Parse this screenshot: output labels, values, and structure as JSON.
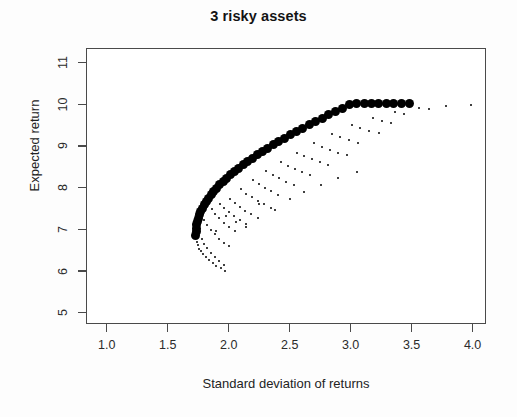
{
  "chart_data": {
    "type": "scatter",
    "title": "3 risky assets",
    "xlabel": "Standard deviation of returns",
    "ylabel": "Expected return",
    "xlim": [
      0.83,
      4.11
    ],
    "ylim": [
      4.73,
      11.35
    ],
    "xticks": [
      1.0,
      1.5,
      2.0,
      2.5,
      3.0,
      3.5,
      4.0
    ],
    "xtick_labels": [
      "1.0",
      "1.5",
      "2.0",
      "2.5",
      "3.0",
      "3.5",
      "4.0"
    ],
    "yticks": [
      5,
      6,
      7,
      8,
      9,
      10,
      11
    ],
    "ytick_labels": [
      "5",
      "6",
      "7",
      "8",
      "9",
      "10",
      "11"
    ],
    "grid": false,
    "legend": null,
    "point_color": "#000000",
    "frame_color": "#4a4a4a",
    "series": [
      {
        "name": "efficient frontier",
        "marker": "filled-circle",
        "marker_size_px": 9,
        "points": [
          [
            1.731,
            6.86
          ],
          [
            1.732,
            6.95
          ],
          [
            1.735,
            7.03
          ],
          [
            1.739,
            7.11
          ],
          [
            1.745,
            7.19
          ],
          [
            1.752,
            7.27
          ],
          [
            1.761,
            7.35
          ],
          [
            1.772,
            7.43
          ],
          [
            1.785,
            7.51
          ],
          [
            1.8,
            7.59
          ],
          [
            1.816,
            7.67
          ],
          [
            1.835,
            7.75
          ],
          [
            1.855,
            7.83
          ],
          [
            1.877,
            7.91
          ],
          [
            1.901,
            7.99
          ],
          [
            1.927,
            8.07
          ],
          [
            1.955,
            8.15
          ],
          [
            1.984,
            8.23
          ],
          [
            2.015,
            8.31
          ],
          [
            2.048,
            8.39
          ],
          [
            2.082,
            8.47
          ],
          [
            2.118,
            8.55
          ],
          [
            2.156,
            8.63
          ],
          [
            2.195,
            8.71
          ],
          [
            2.236,
            8.79
          ],
          [
            2.278,
            8.87
          ],
          [
            2.321,
            8.95
          ],
          [
            2.366,
            9.03
          ],
          [
            2.412,
            9.11
          ],
          [
            2.459,
            9.19
          ],
          [
            2.508,
            9.27
          ],
          [
            2.557,
            9.35
          ],
          [
            2.608,
            9.43
          ],
          [
            2.66,
            9.51
          ],
          [
            2.713,
            9.59
          ],
          [
            2.767,
            9.67
          ],
          [
            2.822,
            9.75
          ],
          [
            2.878,
            9.83
          ],
          [
            2.934,
            9.91
          ],
          [
            2.992,
            9.99
          ],
          [
            3.051,
            10.01
          ],
          [
            3.11,
            10.01
          ],
          [
            3.17,
            10.01
          ],
          [
            3.231,
            10.01
          ],
          [
            3.293,
            10.01
          ],
          [
            3.355,
            10.01
          ],
          [
            3.418,
            10.01
          ],
          [
            3.482,
            10.01
          ]
        ]
      },
      {
        "name": "random portfolios (inefficient)",
        "marker": "tiny-dot",
        "marker_size_px": 2,
        "points": [
          [
            1.742,
            6.7
          ],
          [
            1.748,
            6.62
          ],
          [
            1.76,
            6.54
          ],
          [
            1.775,
            6.47
          ],
          [
            1.793,
            6.4
          ],
          [
            1.815,
            6.33
          ],
          [
            1.84,
            6.26
          ],
          [
            1.868,
            6.19
          ],
          [
            1.899,
            6.13
          ],
          [
            1.934,
            6.07
          ],
          [
            1.971,
            6.01
          ],
          [
            1.78,
            6.78
          ],
          [
            1.8,
            6.66
          ],
          [
            1.824,
            6.55
          ],
          [
            1.852,
            6.44
          ],
          [
            1.884,
            6.34
          ],
          [
            1.92,
            6.24
          ],
          [
            1.96,
            6.15
          ],
          [
            1.8,
            7.22
          ],
          [
            1.824,
            7.1
          ],
          [
            1.852,
            6.99
          ],
          [
            1.884,
            6.88
          ],
          [
            1.92,
            6.78
          ],
          [
            1.96,
            6.68
          ],
          [
            2.004,
            6.59
          ],
          [
            1.86,
            7.5
          ],
          [
            1.89,
            7.38
          ],
          [
            1.924,
            7.27
          ],
          [
            1.962,
            7.16
          ],
          [
            2.004,
            7.06
          ],
          [
            2.049,
            6.96
          ],
          [
            1.93,
            7.62
          ],
          [
            1.964,
            7.51
          ],
          [
            2.002,
            7.41
          ],
          [
            2.044,
            7.31
          ],
          [
            2.09,
            7.22
          ],
          [
            2.139,
            7.13
          ],
          [
            2.01,
            7.74
          ],
          [
            2.048,
            7.64
          ],
          [
            2.09,
            7.54
          ],
          [
            2.136,
            7.45
          ],
          [
            2.186,
            7.36
          ],
          [
            2.24,
            7.28
          ],
          [
            2.1,
            7.96
          ],
          [
            2.142,
            7.86
          ],
          [
            2.188,
            7.77
          ],
          [
            2.238,
            7.68
          ],
          [
            2.292,
            7.6
          ],
          [
            2.35,
            7.52
          ],
          [
            2.2,
            8.18
          ],
          [
            2.246,
            8.08
          ],
          [
            2.296,
            7.99
          ],
          [
            2.35,
            7.91
          ],
          [
            2.408,
            7.83
          ],
          [
            2.31,
            8.4
          ],
          [
            2.36,
            8.31
          ],
          [
            2.414,
            8.22
          ],
          [
            2.472,
            8.14
          ],
          [
            2.534,
            8.07
          ],
          [
            2.43,
            8.62
          ],
          [
            2.484,
            8.53
          ],
          [
            2.542,
            8.45
          ],
          [
            2.604,
            8.37
          ],
          [
            2.67,
            8.3
          ],
          [
            2.56,
            8.84
          ],
          [
            2.618,
            8.76
          ],
          [
            2.68,
            8.68
          ],
          [
            2.746,
            8.61
          ],
          [
            2.816,
            8.54
          ],
          [
            2.7,
            9.06
          ],
          [
            2.762,
            8.98
          ],
          [
            2.828,
            8.91
          ],
          [
            2.898,
            8.84
          ],
          [
            2.972,
            8.78
          ],
          [
            2.85,
            9.28
          ],
          [
            2.916,
            9.21
          ],
          [
            2.986,
            9.14
          ],
          [
            3.06,
            9.08
          ],
          [
            3.01,
            9.5
          ],
          [
            3.08,
            9.43
          ],
          [
            3.154,
            9.37
          ],
          [
            3.232,
            9.31
          ],
          [
            3.18,
            9.66
          ],
          [
            3.254,
            9.6
          ],
          [
            3.332,
            9.54
          ],
          [
            3.36,
            9.82
          ],
          [
            3.438,
            9.77
          ],
          [
            3.56,
            9.92
          ],
          [
            3.64,
            9.88
          ],
          [
            3.78,
            9.96
          ],
          [
            3.99,
            9.99
          ],
          [
            1.98,
            7.32
          ],
          [
            2.06,
            7.18
          ],
          [
            2.14,
            7.05
          ],
          [
            1.9,
            6.96
          ],
          [
            2.25,
            7.6
          ],
          [
            2.38,
            7.46
          ],
          [
            2.5,
            7.73
          ],
          [
            2.62,
            7.9
          ],
          [
            2.76,
            8.06
          ],
          [
            2.9,
            8.22
          ],
          [
            3.05,
            8.38
          ]
        ]
      }
    ]
  }
}
